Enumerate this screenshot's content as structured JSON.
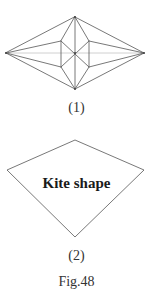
{
  "figure": {
    "caption": "Fig.48",
    "stroke_color": "#555555",
    "light_stroke_color": "#bbbbbb",
    "panels": [
      {
        "label": "(1)",
        "description": "Crease pattern: elongated rhombus with inner hexagon and radiating creases",
        "vertices": {
          "top": [
            75,
            17
          ],
          "bottom": [
            75,
            89
          ],
          "left": [
            6,
            53
          ],
          "right": [
            144,
            53
          ],
          "center": [
            75,
            53
          ],
          "hex_upper_left": [
            61,
            41
          ],
          "hex_upper_right": [
            89,
            41
          ],
          "hex_lower_left": [
            61,
            67
          ],
          "hex_lower_right": [
            89,
            67
          ]
        }
      },
      {
        "label": "(2)",
        "shape_text": "Kite shape",
        "vertices": {
          "top": [
            75,
            140
          ],
          "left": [
            7,
            170
          ],
          "right": [
            144,
            170
          ],
          "bottom": [
            75,
            237
          ]
        }
      }
    ]
  }
}
